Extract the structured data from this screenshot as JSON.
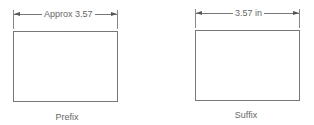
{
  "diagrams": [
    {
      "id": "prefix",
      "dimension_label": "Approx 3.57",
      "caption": "Prefix"
    },
    {
      "id": "suffix",
      "dimension_label": "3.57 in",
      "caption": "Suffix"
    }
  ],
  "colors": {
    "line": "#777777",
    "text": "#666666",
    "background": "#ffffff"
  }
}
